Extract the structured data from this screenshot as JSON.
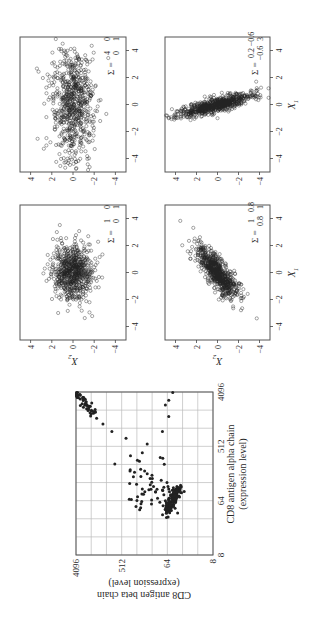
{
  "figure": {
    "orientation": "rotated 90 degrees counterclockwise on page",
    "left_panel": {
      "xlabel_line1": "CD8 antigen alpha chain",
      "xlabel_line2": "(expression level)",
      "ylabel_line1": "CD8 antigen beta chain",
      "ylabel_line2": "(expression level)",
      "ticks": [
        "8",
        "64",
        "512",
        "4096"
      ]
    },
    "grid_panels": {
      "x_axis_label": "X",
      "x_axis_sub": "1",
      "y_axis_label": "X",
      "y_axis_sub": "2",
      "ticks": [
        "-4",
        "-2",
        "0",
        "2",
        "4"
      ],
      "sigma_symbol": "Σ =",
      "panels": [
        {
          "position": "top-left",
          "sigma": [
            [
              "1",
              "0"
            ],
            [
              "0",
              "1"
            ]
          ]
        },
        {
          "position": "top-right",
          "sigma": [
            [
              "4",
              "0"
            ],
            [
              "0",
              "1"
            ]
          ]
        },
        {
          "position": "bottom-left",
          "sigma": [
            [
              "1",
              "0.8"
            ],
            [
              "0.8",
              "1"
            ]
          ]
        },
        {
          "position": "bottom-right",
          "sigma": [
            [
              "0.2",
              "-0.6"
            ],
            [
              "-0.6",
              "3"
            ]
          ]
        }
      ]
    }
  },
  "chart_data": [
    {
      "type": "scatter",
      "title": "",
      "xlabel": "CD8 antigen alpha chain (expression level)",
      "ylabel": "CD8 antigen beta chain (expression level)",
      "scale": "log2",
      "xlim": [
        8,
        4096
      ],
      "ylim": [
        8,
        4096
      ],
      "xticks": [
        8,
        64,
        512,
        4096
      ],
      "yticks": [
        8,
        64,
        512,
        4096
      ],
      "grid": true,
      "description": "Two clusters: dense cluster near alpha~64-128, beta~40-80; second cluster near alpha~2048-4096, beta~2048-4096, with scattered points between",
      "points_approx": [
        [
          40,
          40
        ],
        [
          48,
          45
        ],
        [
          56,
          48
        ],
        [
          64,
          50
        ],
        [
          72,
          52
        ],
        [
          80,
          55
        ],
        [
          90,
          58
        ],
        [
          100,
          60
        ],
        [
          110,
          62
        ],
        [
          128,
          65
        ],
        [
          64,
          70
        ],
        [
          80,
          75
        ],
        [
          96,
          80
        ],
        [
          60,
          90
        ],
        [
          70,
          100
        ],
        [
          90,
          110
        ],
        [
          110,
          120
        ],
        [
          130,
          130
        ],
        [
          150,
          140
        ],
        [
          180,
          160
        ],
        [
          200,
          180
        ],
        [
          100,
          200
        ],
        [
          120,
          260
        ],
        [
          160,
          300
        ],
        [
          200,
          350
        ],
        [
          300,
          250
        ],
        [
          400,
          200
        ],
        [
          260,
          700
        ],
        [
          560,
          160
        ],
        [
          700,
          420
        ],
        [
          900,
          800
        ],
        [
          1200,
          1200
        ],
        [
          1500,
          1600
        ],
        [
          2000,
          2000
        ],
        [
          2400,
          2400
        ],
        [
          2800,
          2600
        ],
        [
          3200,
          3000
        ],
        [
          3600,
          3400
        ],
        [
          4000,
          3800
        ],
        [
          2500,
          70
        ],
        [
          3000,
          60
        ],
        [
          4000,
          50
        ],
        [
          1600,
          60
        ],
        [
          900,
          80
        ]
      ]
    },
    {
      "type": "scatter",
      "title": "Σ = [[1,0],[0,1]]",
      "xlabel": "X1",
      "ylabel": "X2",
      "xlim": [
        -5,
        5
      ],
      "ylim": [
        -5,
        5
      ],
      "xticks": [
        -4,
        -2,
        0,
        2,
        4
      ],
      "yticks": [
        -4,
        -2,
        0,
        2,
        4
      ],
      "description": "Bivariate normal samples, circular cloud centered at origin"
    },
    {
      "type": "scatter",
      "title": "Σ = [[4,0],[0,1]]",
      "xlabel": "X1",
      "ylabel": "X2",
      "xlim": [
        -5,
        5
      ],
      "ylim": [
        -5,
        5
      ],
      "xticks": [
        -4,
        -2,
        0,
        2,
        4
      ],
      "yticks": [
        -4,
        -2,
        0,
        2,
        4
      ],
      "description": "Bivariate normal samples, elongated horizontally (var X1 = 4)"
    },
    {
      "type": "scatter",
      "title": "Σ = [[1,0.8],[0.8,1]]",
      "xlabel": "X1",
      "ylabel": "X2",
      "xlim": [
        -5,
        5
      ],
      "ylim": [
        -5,
        5
      ],
      "xticks": [
        -4,
        -2,
        0,
        2,
        4
      ],
      "yticks": [
        -4,
        -2,
        0,
        2,
        4
      ],
      "description": "Bivariate normal samples, positively correlated diagonal cloud"
    },
    {
      "type": "scatter",
      "title": "Σ = [[0.2,-0.6],[-0.6,3]]",
      "xlabel": "X1",
      "ylabel": "X2",
      "xlim": [
        -5,
        5
      ],
      "ylim": [
        -5,
        5
      ],
      "xticks": [
        -4,
        -2,
        0,
        2,
        4
      ],
      "yticks": [
        -4,
        -2,
        0,
        2,
        4
      ],
      "description": "Bivariate normal samples, narrow, steep negatively correlated cloud"
    }
  ]
}
